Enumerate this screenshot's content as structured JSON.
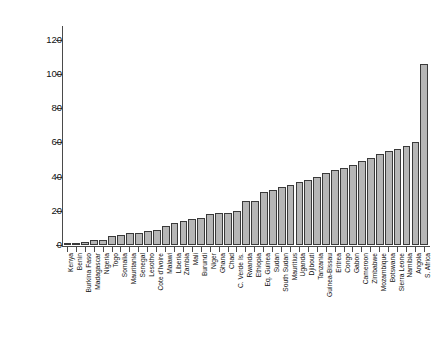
{
  "chart_data": {
    "type": "bar",
    "title": "",
    "subtitle": "",
    "xlabel": "",
    "ylabel": "Ruling party age (2018)",
    "ylim": [
      0,
      128
    ],
    "yticks": [
      0,
      20,
      40,
      60,
      80,
      100,
      120
    ],
    "grid": false,
    "legend": null,
    "bar_fill_color": "#b6b6b6",
    "bar_edge_color": "#3a3a3a",
    "axis_color": "#4a4a4a",
    "background_color": "#ffffff",
    "categories": [
      "Kenya",
      "Benin",
      "Burkina Faso",
      "Madagascar",
      "Nigeria",
      "Togo",
      "Somalia",
      "Mauritania",
      "Senegal",
      "Lesotho",
      "Cote d'Ivoire",
      "Malawi",
      "Liberia",
      "Zambia",
      "Mali",
      "Burundi",
      "Niger",
      "Ghana",
      "Chad",
      "C. Verde Is.",
      "Rwanda",
      "Ethiopia",
      "Eq. Guinea",
      "Sudan",
      "South Sudan",
      "Mauritius",
      "Uganda",
      "Djibouti",
      "Tanzania",
      "Guinea-Bissau",
      "Eritrea",
      "Congo",
      "Gabon",
      "Cameroon",
      "Zimbabwe",
      "Mozambique",
      "Botswana",
      "Sierra Leone",
      "Namibia",
      "Angola",
      "S. Africa"
    ],
    "values": [
      1,
      1,
      2,
      3,
      3,
      5,
      6,
      7,
      7,
      8,
      9,
      11,
      13,
      14,
      15,
      16,
      18,
      19,
      19,
      20,
      26,
      26,
      31,
      32,
      34,
      35,
      37,
      38,
      40,
      42,
      44,
      45,
      47,
      49,
      51,
      53,
      55,
      56,
      58,
      60,
      106
    ]
  }
}
